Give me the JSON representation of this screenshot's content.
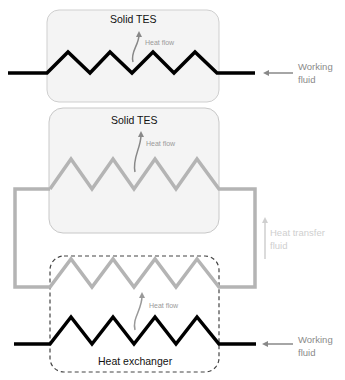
{
  "diagram": {
    "top_unit": {
      "title": "Solid TES",
      "heat_flow_label": "Heat flow",
      "inlet_label_line1": "Working",
      "inlet_label_line2": "fluid"
    },
    "middle_unit": {
      "title": "Solid TES",
      "heat_flow_label": "Heat flow"
    },
    "htf_loop": {
      "label_line1": "Heat transfer",
      "label_line2": "fluid"
    },
    "bottom_unit": {
      "title": "Heat exchanger",
      "heat_flow_label": "Heat flow",
      "inlet_label_line1": "Working",
      "inlet_label_line2": "fluid"
    },
    "colors": {
      "working_fluid_line": "#000000",
      "htf_line": "#b4b4b4",
      "tes_box_fill": "#f3f3f3",
      "tes_box_border": "#c8c8c8",
      "arrow": "#888888",
      "dashed_border": "#444444"
    }
  }
}
